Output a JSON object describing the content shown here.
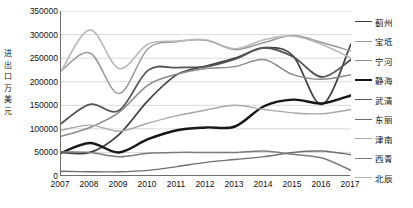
{
  "chart_data": {
    "type": "line",
    "title": "",
    "xlabel": "",
    "ylabel": "进出口万美元",
    "ylabel_chars": [
      "进",
      "出",
      "口",
      "万",
      "美",
      "元"
    ],
    "x": [
      2007,
      2008,
      2009,
      2010,
      2011,
      2012,
      2013,
      2014,
      2015,
      2016,
      2017
    ],
    "xtick_labels": [
      "2007",
      "2008",
      "2009",
      "2010",
      "2011",
      "2012",
      "2013",
      "2014",
      "2015",
      "2016",
      "2017"
    ],
    "ytick_labels": [
      "350000",
      "300000",
      "250000",
      "200000",
      "150000",
      "100000",
      "50000",
      "0"
    ],
    "ytick_values": [
      350000,
      300000,
      250000,
      200000,
      150000,
      100000,
      50000,
      0
    ],
    "ylim": [
      0,
      350000
    ],
    "xlim": [
      2007,
      2017
    ],
    "grid": true,
    "grid_axis": "y",
    "legend_position": "right",
    "series": [
      {
        "name": "蓟州",
        "color": "#3f3f3f",
        "width": 1.7,
        "values": [
          50000,
          50000,
          88000,
          160000,
          215000,
          233000,
          250000,
          272000,
          255000,
          152000,
          280000
        ]
      },
      {
        "name": "宝坻",
        "color": "#9a9a9a",
        "width": 1.5,
        "values": [
          223000,
          261000,
          175000,
          270000,
          285000,
          288000,
          268000,
          283000,
          298000,
          283000,
          265000
        ]
      },
      {
        "name": "宁河",
        "color": "#8a8a8a",
        "width": 1.5,
        "values": [
          84000,
          103000,
          135000,
          193000,
          216000,
          228000,
          232000,
          247000,
          215000,
          205000,
          215000
        ]
      },
      {
        "name": "静海",
        "color": "#171717",
        "width": 2.4,
        "values": [
          49000,
          70000,
          50000,
          78000,
          97000,
          103000,
          105000,
          148000,
          162000,
          154000,
          171000
        ]
      },
      {
        "name": "武清",
        "color": "#555555",
        "width": 1.8,
        "values": [
          111000,
          152000,
          139000,
          224000,
          230000,
          232000,
          248000,
          272000,
          253000,
          210000,
          247000
        ]
      },
      {
        "name": "东丽",
        "color": "#6f6f6f",
        "width": 1.4,
        "values": [
          10000,
          9000,
          9000,
          12000,
          20000,
          29000,
          35000,
          41000,
          50000,
          53000,
          45000
        ]
      },
      {
        "name": "津南",
        "color": "#a8a8a8",
        "width": 1.4,
        "values": [
          97000,
          108000,
          95000,
          112000,
          128000,
          140000,
          150000,
          141000,
          134000,
          132000,
          141000
        ]
      },
      {
        "name": "西青",
        "color": "#7b7b7b",
        "width": 1.5,
        "values": [
          51000,
          50000,
          41000,
          48000,
          50000,
          50000,
          50000,
          53000,
          46000,
          38000,
          12000
        ]
      },
      {
        "name": "北辰",
        "color": "#b9b9b9",
        "width": 1.6,
        "values": [
          222000,
          310000,
          228000,
          280000,
          286000,
          289000,
          270000,
          289000,
          297000,
          279000,
          250000
        ]
      }
    ]
  }
}
